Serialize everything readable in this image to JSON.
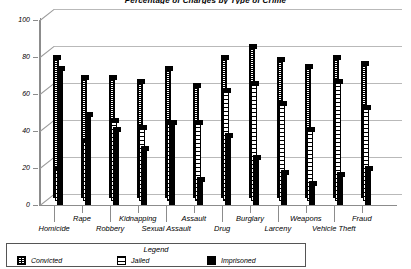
{
  "chart_data": {
    "type": "bar",
    "title": "Percentage of Charges by Type of Crime",
    "xlabel": "",
    "ylabel": "",
    "ylim": [
      0,
      100
    ],
    "yticks": [
      0,
      20,
      40,
      60,
      80,
      100
    ],
    "grid": true,
    "legend_position": "bottom",
    "legend_title": "Legend",
    "categories": [
      "Homicide",
      "Rape",
      "Robbery",
      "Kidnapping",
      "Sexual Assault",
      "Assault",
      "Drug",
      "Burglary",
      "Larceny",
      "Weapons",
      "Vehicle Theft",
      "Fraud"
    ],
    "series": [
      {
        "name": "Convicted",
        "pattern": "dotted",
        "values": [
          76,
          65,
          65,
          63,
          70,
          61,
          76,
          82,
          75,
          71,
          76,
          73
        ]
      },
      {
        "name": "Jailed",
        "pattern": "horizontal-lines",
        "values": [
          18,
          33,
          44,
          40,
          43,
          43,
          60,
          64,
          53,
          39,
          65,
          51
        ]
      },
      {
        "name": "Imprisoned",
        "pattern": "solid",
        "values": [
          74,
          49,
          41,
          31,
          45,
          14,
          38,
          26,
          18,
          12,
          17,
          20
        ]
      }
    ]
  },
  "legend": {
    "title": "Legend",
    "entries": [
      {
        "label": "Convicted"
      },
      {
        "label": "Jailed"
      },
      {
        "label": "Imprisoned"
      }
    ]
  }
}
